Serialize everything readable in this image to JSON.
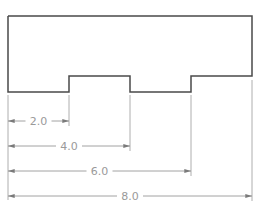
{
  "diagram": {
    "type": "dimensioned-profile",
    "colors": {
      "outline": "#4a4a4a",
      "dimension": "#8a8a8a",
      "text": "#9a9a9a",
      "background": "#ffffff"
    },
    "outline_points": [
      [
        8,
        16
      ],
      [
        252,
        16
      ],
      [
        252,
        76
      ],
      [
        191,
        76
      ],
      [
        191,
        92
      ],
      [
        130,
        92
      ],
      [
        130,
        76
      ],
      [
        69,
        76
      ],
      [
        69,
        92
      ],
      [
        8,
        92
      ]
    ],
    "dimensions": [
      {
        "label": "2.0",
        "value": 2.0,
        "x1": 8,
        "x2": 69,
        "y": 121
      },
      {
        "label": "4.0",
        "value": 4.0,
        "x1": 8,
        "x2": 130,
        "y": 146
      },
      {
        "label": "6.0",
        "value": 6.0,
        "x1": 8,
        "x2": 191,
        "y": 171
      },
      {
        "label": "8.0",
        "value": 8.0,
        "x1": 8,
        "x2": 252,
        "y": 196
      }
    ]
  }
}
